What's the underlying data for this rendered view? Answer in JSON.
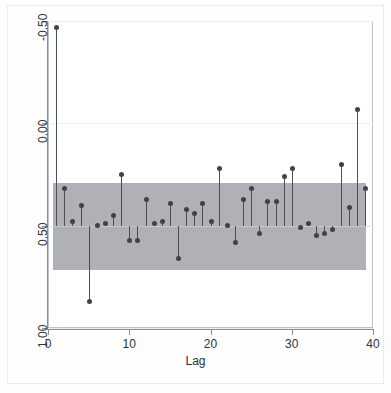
{
  "figure": {
    "kind": "autocorrelation-plot",
    "background_color": "#ffffff",
    "marker_color": "#3f4248",
    "stem_color": "#4c4f56",
    "band_color": "#a8aab1",
    "axis_color": "#8a8d93"
  },
  "axes": {
    "x_title": "Lag",
    "x_ticks": [
      "0",
      "10",
      "20",
      "30",
      "40"
    ],
    "y_ticks": [
      "1.00",
      "0.50",
      "0.00",
      "-0.50"
    ]
  },
  "chart_data": {
    "type": "bar",
    "title": "",
    "subtitle": "",
    "xlabel": "Lag",
    "ylabel": "",
    "xlim": [
      0,
      40
    ],
    "ylim": [
      -0.5,
      1.0
    ],
    "xticks": [
      0,
      10,
      20,
      30,
      40
    ],
    "yticks": [
      -0.5,
      0.0,
      0.5,
      1.0
    ],
    "grid": true,
    "legend": "none",
    "annotations": [
      "shaded horizontal band marks the approximate 95% confidence bounds",
      "stems drawn from zero to each autocorrelation value with a round marker at the tip"
    ],
    "confidence_band": {
      "upper": 0.21,
      "lower": -0.215
    },
    "categories": [
      1,
      2,
      3,
      4,
      5,
      6,
      7,
      8,
      9,
      10,
      11,
      12,
      13,
      14,
      15,
      16,
      17,
      18,
      19,
      20,
      21,
      22,
      23,
      24,
      25,
      26,
      27,
      28,
      29,
      30,
      31,
      32,
      33,
      34,
      35,
      36,
      37,
      38,
      39
    ],
    "values": [
      0.97,
      0.18,
      0.02,
      0.1,
      -0.37,
      0.0,
      0.01,
      0.05,
      0.25,
      -0.07,
      -0.07,
      0.13,
      0.01,
      0.02,
      0.11,
      -0.16,
      0.08,
      0.06,
      0.11,
      0.02,
      0.28,
      0.0,
      -0.08,
      0.13,
      0.18,
      -0.04,
      0.12,
      0.12,
      0.24,
      0.28,
      -0.01,
      0.01,
      -0.05,
      -0.04,
      -0.02,
      0.3,
      0.09,
      0.57,
      0.18
    ],
    "series": [
      {
        "name": "autocorrelation",
        "values": [
          0.97,
          0.18,
          0.02,
          0.1,
          -0.37,
          0.0,
          0.01,
          0.05,
          0.25,
          -0.07,
          -0.07,
          0.13,
          0.01,
          0.02,
          0.11,
          -0.16,
          0.08,
          0.06,
          0.11,
          0.02,
          0.28,
          0.0,
          -0.08,
          0.13,
          0.18,
          -0.04,
          0.12,
          0.12,
          0.24,
          0.28,
          -0.01,
          0.01,
          -0.05,
          -0.04,
          -0.02,
          0.3,
          0.09,
          0.57,
          0.18
        ]
      }
    ]
  }
}
